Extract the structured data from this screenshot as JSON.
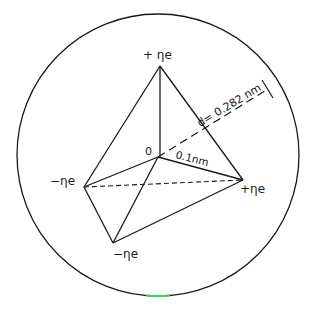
{
  "diagram": {
    "center_label": "0",
    "charges": {
      "top": "+ ηe",
      "left": "−ηe",
      "bottom": "−ηe",
      "right": "+ηe"
    },
    "radius_label": "0.1nm",
    "diameter_label": "d= 0.282 nm",
    "colors": {
      "line": "#1a1a1a",
      "background": "#ffffff",
      "accent_green": "#3ecf4a"
    }
  }
}
